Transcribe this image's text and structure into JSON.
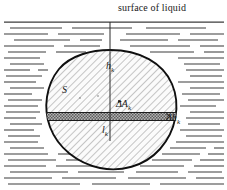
{
  "figure": {
    "title": "surface of liquid",
    "width": 227,
    "height": 190,
    "background_color": "#ffffff",
    "ink_color": "#1a1a1a",
    "liquid_line_color": "#3a3a3a",
    "strip_fill_color": "#9a9a9a",
    "hatch_color": "#6e6e6e",
    "body_fill_color": "#f2f2f2"
  },
  "labels": {
    "surface_of_liquid": "surface of liquid",
    "depth_h": "h",
    "depth_h_sub": "k",
    "area_S": "S",
    "delta_area": "ΔA",
    "delta_area_sub": "k",
    "delta_height": "Δh",
    "delta_height_sub": "k",
    "chord_l": "l",
    "chord_l_sub": "k"
  },
  "geometry": {
    "surface_line_y": 22,
    "vertical_line_x": 110,
    "vertical_line_from_y": 22,
    "vertical_line_to_y": 140,
    "strip_top_y": 112,
    "strip_bottom_y": 120,
    "strip_left_x": 48,
    "strip_right_x": 168,
    "body_center_x": 110,
    "body_center_y": 103,
    "body_top_y": 50,
    "body_bottom_y": 168,
    "body_left_x": 47,
    "body_right_x": 176
  }
}
